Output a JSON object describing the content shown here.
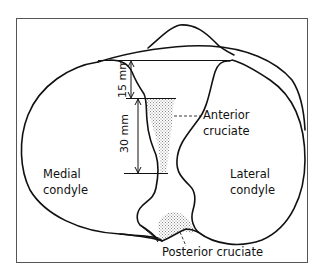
{
  "figure": {
    "labels": {
      "anterior_cruciate": [
        "Anterior",
        "cruciate"
      ],
      "posterior_cruciate": "Posterior cruciate",
      "medial_condyle": [
        "Medial",
        "condyle"
      ],
      "lateral_condyle": [
        "Lateral",
        "condyle"
      ]
    },
    "dimensions": {
      "upper": "15 mm",
      "lower": "30 mm"
    },
    "colors": {
      "line": "#111111",
      "frame": "#555555",
      "stipple": "#9a9a9a"
    }
  }
}
